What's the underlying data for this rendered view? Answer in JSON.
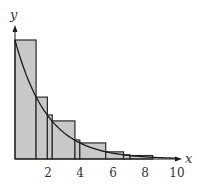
{
  "chart_data": {
    "type": "bar",
    "title": "",
    "xlabel": "x",
    "ylabel": "y",
    "xlim": [
      0,
      10
    ],
    "ylim": [
      0,
      1
    ],
    "xticks": [
      2,
      4,
      6,
      8,
      10
    ],
    "xtick_labels": [
      "2",
      "4",
      "6",
      "8",
      "10"
    ],
    "grid": false,
    "curve": {
      "expression": "e^(-x/2)",
      "x_range": [
        0,
        10
      ]
    },
    "bars": [
      {
        "x0": 0.0,
        "x1": 1.3,
        "height": 1.0
      },
      {
        "x0": 1.3,
        "x1": 2.0,
        "height": 0.52
      },
      {
        "x0": 2.0,
        "x1": 2.3,
        "height": 0.37
      },
      {
        "x0": 2.3,
        "x1": 3.7,
        "height": 0.32
      },
      {
        "x0": 3.7,
        "x1": 4.0,
        "height": 0.16
      },
      {
        "x0": 4.0,
        "x1": 5.6,
        "height": 0.135
      },
      {
        "x0": 5.6,
        "x1": 6.7,
        "height": 0.06
      },
      {
        "x0": 6.7,
        "x1": 7.1,
        "height": 0.035
      },
      {
        "x0": 7.1,
        "x1": 8.5,
        "height": 0.029
      }
    ],
    "colors": {
      "bar_fill": "#c8c8c8",
      "stroke": "#2a2a2a"
    }
  },
  "axes": {
    "x_label": "x",
    "y_label": "y",
    "ticks": [
      "2",
      "4",
      "6",
      "8",
      "10"
    ]
  }
}
